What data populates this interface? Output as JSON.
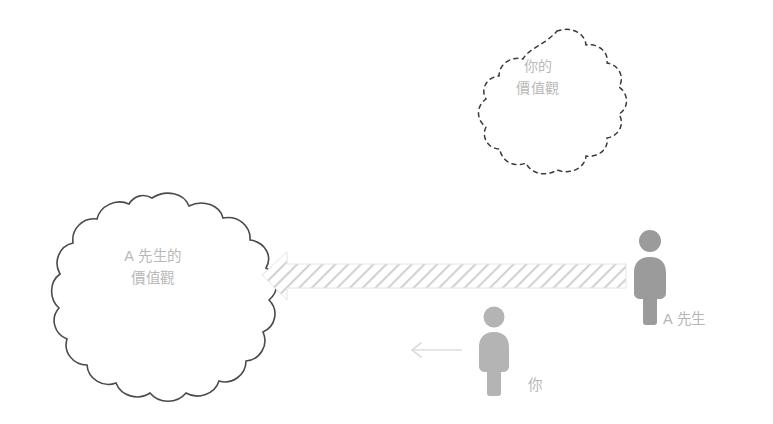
{
  "diagram": {
    "title": "",
    "background_color": "#ffffff",
    "clouds": [
      {
        "id": "your-values",
        "name": "your-values-cloud",
        "text": "你的\n價值觀",
        "line1": "你的",
        "line2": "價值觀",
        "outline_style": "dashed",
        "outline_color": "#3a3a3a",
        "text_color": "#b9b9b9"
      },
      {
        "id": "mr-a-values",
        "name": "mr-a-values-cloud",
        "text": "A 先生的\n價值觀",
        "line1": "A 先生的",
        "line2": "價值觀",
        "outline_style": "solid",
        "outline_color": "#4a4a4a",
        "text_color": "#b9b9b9"
      }
    ],
    "figures": [
      {
        "id": "mr-a",
        "name": "person-mr-a",
        "label": "A 先生",
        "color": "#9b9b9b",
        "label_color": "#b6b6b6"
      },
      {
        "id": "you",
        "name": "person-you",
        "label": "你",
        "color": "#b4b4b4",
        "label_color": "#bdbdbd"
      }
    ],
    "arrows": [
      {
        "id": "influence-beam",
        "name": "hatched-influence-arrow",
        "direction": "left",
        "style": "hatched",
        "fill_color": "#d2d2d2",
        "label": ""
      },
      {
        "id": "you-direction",
        "name": "you-direction-arrow",
        "direction": "left",
        "style": "thin-line",
        "fill_color": "#dcdcdc",
        "label": ""
      }
    ],
    "colors": {
      "background": "#ffffff",
      "cloud_text": "#b9b9b9",
      "cloud_outline_solid": "#4a4a4a",
      "cloud_outline_dashed": "#3a3a3a",
      "figure_dark": "#9b9b9b",
      "figure_light": "#b4b4b4",
      "hatch": "#d2d2d2",
      "label": "#b6b6b6"
    }
  }
}
